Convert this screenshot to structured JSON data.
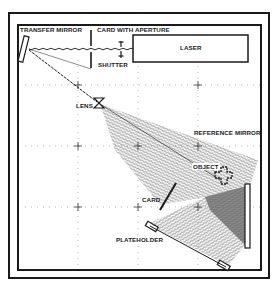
{
  "diagram": {
    "labels": {
      "transfer_mirror": "TRANSFER MIRROR",
      "card_with_aperture": "CARD WITH APERTURE",
      "laser": "LASER",
      "shutter": "SHUTTER",
      "lens": "LENS",
      "reference_mirror": "REFERENCE MIRROR",
      "object": "OBJECT",
      "card": "CARD",
      "plateholder": "PLATEHOLDER"
    },
    "colors": {
      "line": "#1a1a1a",
      "background": "#ffffff",
      "beam": "#555555"
    }
  }
}
